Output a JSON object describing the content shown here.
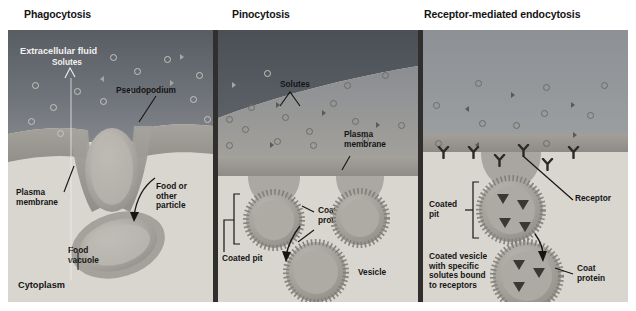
{
  "figure": {
    "type": "biology-diagram",
    "panels": [
      {
        "id": "phagocytosis",
        "title": "Phagocytosis",
        "labels": [
          {
            "name": "extracellular-fluid",
            "text": "Extracellular fluid"
          },
          {
            "name": "solutes",
            "text": "Solutes"
          },
          {
            "name": "pseudopodium",
            "text": "Pseudopodium"
          },
          {
            "name": "plasma-membrane",
            "text": "Plasma\nmembrane"
          },
          {
            "name": "food-or-other-particle",
            "text": "Food or\nother\nparticle"
          },
          {
            "name": "food-vacuole",
            "text": "Food\nvacuole"
          },
          {
            "name": "cytoplasm",
            "text": "Cytoplasm"
          }
        ]
      },
      {
        "id": "pinocytosis",
        "title": "Pinocytosis",
        "labels": [
          {
            "name": "solutes",
            "text": "Solutes"
          },
          {
            "name": "plasma-membrane",
            "text": "Plasma\nmembrane"
          },
          {
            "name": "coat-protein",
            "text": "Coat\nprotein"
          },
          {
            "name": "coated-pit",
            "text": "Coated pit"
          },
          {
            "name": "vesicle",
            "text": "Vesicle"
          }
        ]
      },
      {
        "id": "receptor-mediated-endocytosis",
        "title": "Receptor-mediated endocytosis",
        "labels": [
          {
            "name": "receptor",
            "text": "Receptor"
          },
          {
            "name": "coated-pit",
            "text": "Coated\npit"
          },
          {
            "name": "coat-protein",
            "text": "Coat\nprotein"
          },
          {
            "name": "coated-vesicle",
            "text": "Coated vesicle\nwith specific\nsolutes bound\nto receptors"
          }
        ]
      }
    ],
    "colors": {
      "extracellular_fluid": "#6e727a",
      "extracellular_fluid_dark": "#565a61",
      "cytoplasm": "#d9d6d0",
      "membrane": "#9a9792",
      "divider": "#302f2d",
      "page_background": "#ffffff",
      "text": "#141414",
      "text_on_dark": "#f2f1ee"
    },
    "glyphs": {
      "solute_circle": "open-circle",
      "solute_triangle": "filled-triangle",
      "receptor": "y-shape",
      "coat": "dotted-ring"
    }
  }
}
